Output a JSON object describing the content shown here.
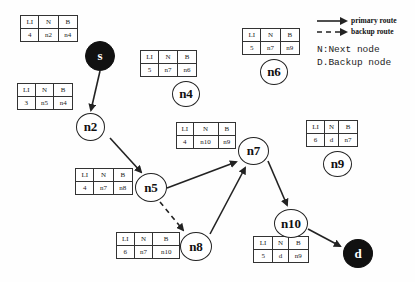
{
  "table_headers": [
    "LI",
    "N",
    "B"
  ],
  "nodes": {
    "s": {
      "label": "s",
      "type": "source",
      "table": {
        "LI": "4",
        "N": "n2",
        "B": "n4"
      }
    },
    "n2": {
      "label": "n2",
      "type": "intermediate",
      "table": {
        "LI": "3",
        "N": "n5",
        "B": "n4"
      }
    },
    "n4": {
      "label": "n4",
      "type": "intermediate",
      "table": {
        "LI": "5",
        "N": "n7",
        "B": "n6"
      }
    },
    "n6": {
      "label": "n6",
      "type": "intermediate",
      "table": {
        "LI": "5",
        "N": "n7",
        "B": "n9"
      }
    },
    "n7": {
      "label": "n7",
      "type": "intermediate",
      "table": {
        "LI": "4",
        "N": "n10",
        "B": "n9"
      }
    },
    "n9": {
      "label": "n9",
      "type": "intermediate",
      "table": {
        "LI": "6",
        "N": "d",
        "B": "n7"
      }
    },
    "n5": {
      "label": "n5",
      "type": "intermediate",
      "table": {
        "LI": "4",
        "N": "n7",
        "B": "n8"
      }
    },
    "n8": {
      "label": "n8",
      "type": "intermediate",
      "table": {
        "LI": "6",
        "N": "n7",
        "B": "n10"
      }
    },
    "n10": {
      "label": "n10",
      "type": "intermediate",
      "table": {
        "LI": "5",
        "N": "d",
        "B": "n9"
      }
    },
    "d": {
      "label": "d",
      "type": "destination"
    }
  },
  "edges": [
    {
      "from": "s",
      "to": "n2",
      "style": "primary"
    },
    {
      "from": "n2",
      "to": "n5",
      "style": "primary"
    },
    {
      "from": "n5",
      "to": "n7",
      "style": "primary"
    },
    {
      "from": "n5",
      "to": "n8",
      "style": "backup"
    },
    {
      "from": "n8",
      "to": "n7",
      "style": "primary"
    },
    {
      "from": "n7",
      "to": "n10",
      "style": "primary"
    },
    {
      "from": "n10",
      "to": "d",
      "style": "primary"
    }
  ],
  "legend": {
    "primary_route": "primary route",
    "backup_route": "backup route",
    "next_node": "N:Next node",
    "backup_node": "D.Backup node"
  },
  "colors": {
    "stroke": "#222222",
    "endpoint_fill": "#111111",
    "background": "#ffffff"
  }
}
